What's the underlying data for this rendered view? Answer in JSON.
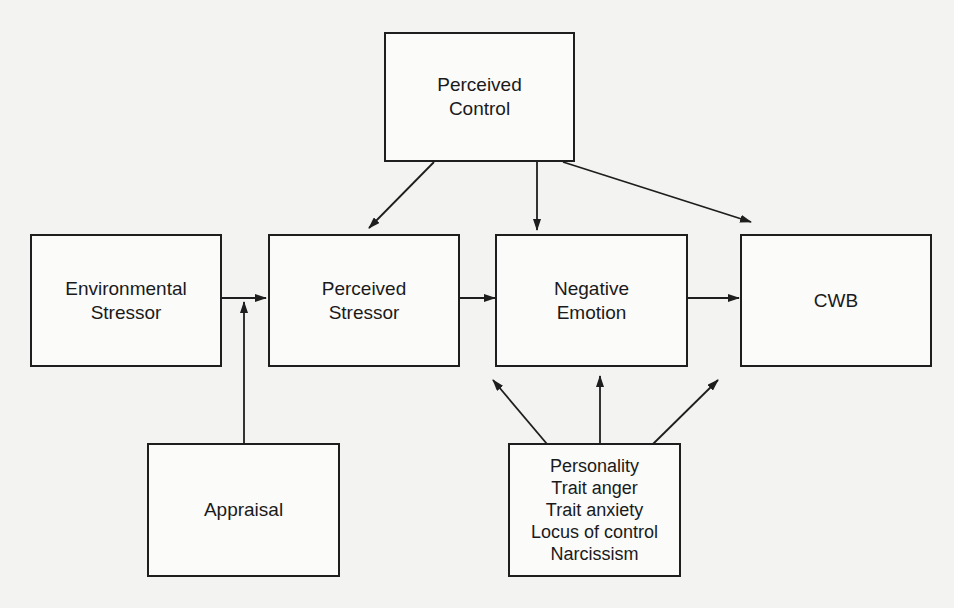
{
  "diagram": {
    "nodes": {
      "perceived_control": {
        "lines": [
          "Perceived",
          "Control"
        ]
      },
      "environmental_stressor": {
        "lines": [
          "Environmental",
          "Stressor"
        ]
      },
      "perceived_stressor": {
        "lines": [
          "Perceived",
          "Stressor"
        ]
      },
      "negative_emotion": {
        "lines": [
          "Negative",
          "Emotion"
        ]
      },
      "cwb": {
        "lines": [
          "CWB"
        ]
      },
      "appraisal": {
        "lines": [
          "Appraisal"
        ]
      },
      "personality": {
        "lines": [
          "Personality",
          "Trait anger",
          "Trait anxiety",
          "Locus of control",
          "Narcissism"
        ]
      }
    },
    "edges": [
      {
        "from": "Environmental Stressor",
        "to": "Perceived Stressor"
      },
      {
        "from": "Perceived Stressor",
        "to": "Negative Emotion"
      },
      {
        "from": "Negative Emotion",
        "to": "CWB"
      },
      {
        "from": "Perceived Control",
        "to": "Perceived Stressor"
      },
      {
        "from": "Perceived Control",
        "to": "Negative Emotion"
      },
      {
        "from": "Perceived Control",
        "to": "CWB"
      },
      {
        "from": "Appraisal",
        "to": "Environmental Stressor → Perceived Stressor path (moderator)"
      },
      {
        "from": "Personality",
        "to": "Perceived Stressor → Negative Emotion path (moderator)"
      },
      {
        "from": "Personality",
        "to": "Negative Emotion"
      },
      {
        "from": "Personality",
        "to": "Negative Emotion → CWB path (moderator)"
      }
    ],
    "colors": {
      "stroke": "#1e1e1e",
      "background": "#f3f3f1",
      "box_fill": "#fbfbfa"
    }
  }
}
